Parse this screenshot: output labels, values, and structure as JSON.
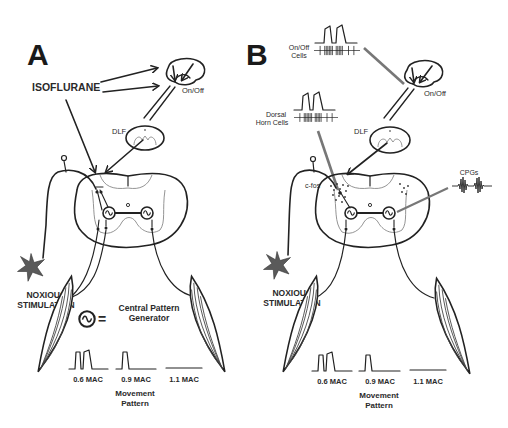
{
  "figure": {
    "panels": [
      {
        "letter": "A",
        "labels": {
          "drug": "ISOFLURANE",
          "brainstem": "On/Off",
          "tract": "DLF",
          "stimulus_line1": "NOXIOUS",
          "stimulus_line2": "STIMULATION",
          "legend_line1": "Central Pattern",
          "legend_line2": "Generator",
          "legend_equals": "="
        },
        "movement": {
          "doses": [
            "0.6 MAC",
            "0.9 MAC",
            "1.1 MAC"
          ],
          "title_line1": "Movement",
          "title_line2": "Pattern"
        }
      },
      {
        "letter": "B",
        "labels": {
          "onoff_cells_line1": "On/Off",
          "onoff_cells_line2": "Cells",
          "dorsal_line1": "Dorsal",
          "dorsal_line2": "Horn Cells",
          "brainstem": "On/Off",
          "tract": "DLF",
          "cfos": "c-fos",
          "cpgs": "CPGs",
          "stimulus_line1": "NOXIOUS",
          "stimulus_line2": "STIMULATION"
        },
        "movement": {
          "doses": [
            "0.6 MAC",
            "0.9 MAC",
            "1.1 MAC"
          ],
          "title_line1": "Movement",
          "title_line2": "Pattern"
        }
      }
    ],
    "colors": {
      "ink": "#222222",
      "star": "#555555",
      "background": "#ffffff"
    }
  }
}
